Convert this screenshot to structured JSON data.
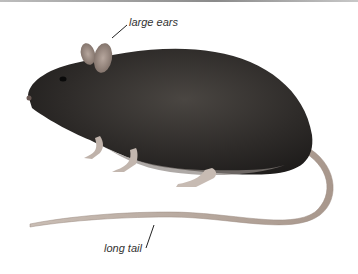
{
  "illustration": {
    "subject": "rat",
    "annotations": [
      {
        "label": "large ears"
      },
      {
        "label": "long tail"
      }
    ]
  }
}
